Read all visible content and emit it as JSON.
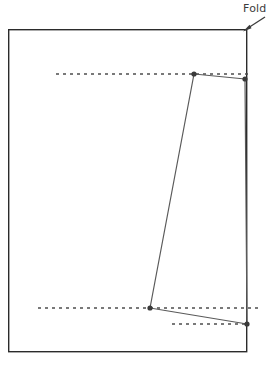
{
  "figure": {
    "width": 277,
    "height": 366,
    "background": "#ffffff"
  },
  "annotations": {
    "fold_label": "Fold",
    "fold_label_position": {
      "x": 243,
      "y": 2
    },
    "arrow": {
      "name": "fold-arrow",
      "from": {
        "x": 264,
        "y": 18
      },
      "to": {
        "x": 244,
        "y": 31
      },
      "color": "#3c3c3c"
    }
  },
  "colors": {
    "sheet_border": "#2b2b2b",
    "dashed_line": "#4d4d4d",
    "crease_line": "#5a5a5a",
    "vertex_fill": "#3a3a3a",
    "label_text": "#3c3c3c"
  },
  "shapes": {
    "sheet": {
      "name": "paper-sheet",
      "x": 8,
      "y": 29,
      "width": 239,
      "height": 323,
      "stroke": "#2b2b2b",
      "stroke_width": 1.4,
      "fill": "none"
    },
    "dashed_lines": [
      {
        "name": "upper-dashed-guide",
        "x1": 56,
        "y1": 74,
        "x2": 249,
        "y2": 74,
        "dash": "3 4",
        "stroke": "#4d4d4d",
        "stroke_width": 1.3
      },
      {
        "name": "lower-dashed-guide",
        "x1": 38,
        "y1": 308,
        "x2": 259,
        "y2": 308,
        "dash": "3 4",
        "stroke": "#4d4d4d",
        "stroke_width": 1.3
      },
      {
        "name": "lower-short-dashed-guide",
        "x1": 172,
        "y1": 324,
        "x2": 247,
        "y2": 324,
        "dash": "3 4",
        "stroke": "#4d4d4d",
        "stroke_width": 1.3
      }
    ],
    "crease_path": {
      "name": "fold-crease-path",
      "stroke": "#5a5a5a",
      "stroke_width": 1.2,
      "points": [
        {
          "name": "vertex-top-left",
          "x": 194,
          "y": 74
        },
        {
          "name": "vertex-top-right",
          "x": 245,
          "y": 79
        },
        {
          "name": "vertex-bottom-right",
          "x": 247,
          "y": 324
        },
        {
          "name": "vertex-bottom-left",
          "x": 150,
          "y": 308
        }
      ],
      "segments": [
        {
          "name": "segment-top",
          "from": 0,
          "to": 1
        },
        {
          "name": "segment-right",
          "from": 1,
          "to": 2
        },
        {
          "name": "segment-bottom",
          "from": 2,
          "to": 3
        },
        {
          "name": "segment-diagonal",
          "from": 3,
          "to": 0
        }
      ]
    },
    "vertices": [
      {
        "name": "vertex-top-left",
        "x": 194,
        "y": 74,
        "r": 2.6
      },
      {
        "name": "vertex-top-right",
        "x": 245,
        "y": 79,
        "r": 2.6
      },
      {
        "name": "vertex-bottom-left",
        "x": 150,
        "y": 308,
        "r": 2.6
      },
      {
        "name": "vertex-bottom-right",
        "x": 247,
        "y": 324,
        "r": 2.6
      }
    ]
  }
}
